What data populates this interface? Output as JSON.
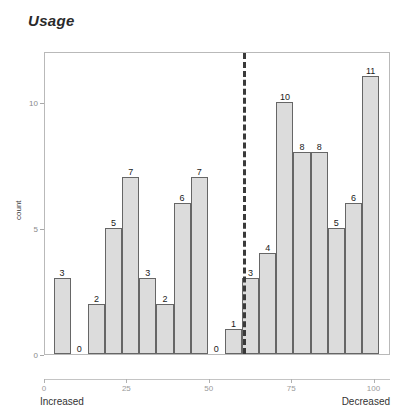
{
  "chart": {
    "title": "Usage"
  },
  "axes": {
    "y_label": "count",
    "x_left_label": "Increased",
    "x_right_label": "Decreased"
  },
  "chart_data": {
    "type": "bar",
    "title": "Usage",
    "xlabel": "",
    "ylabel": "count",
    "xlim": [
      0,
      105
    ],
    "ylim": [
      0,
      12
    ],
    "grid": false,
    "legend": null,
    "x_ticks": [
      0,
      25,
      50,
      75,
      100
    ],
    "x_tick_labels": [
      "0",
      "25",
      "50",
      "75",
      "100"
    ],
    "y_ticks": [
      0,
      5,
      10
    ],
    "y_tick_labels": [
      "0",
      "5",
      "10"
    ],
    "x_axis_endpoints": {
      "left": "Increased",
      "right": "Decreased"
    },
    "bin_centers": [
      5.2,
      10.4,
      15.6,
      20.8,
      26.0,
      31.2,
      36.4,
      41.6,
      46.8,
      52.0,
      57.2,
      62.4,
      67.6,
      72.8,
      78.0,
      83.2,
      88.4,
      93.6,
      98.8
    ],
    "values": [
      3,
      0,
      2,
      5,
      7,
      3,
      2,
      6,
      7,
      0,
      1,
      3,
      4,
      10,
      8,
      8,
      5,
      6,
      11
    ],
    "bar_labels": [
      "3",
      "0",
      "2",
      "5",
      "7",
      "3",
      "2",
      "6",
      "7",
      "0",
      "1",
      "3",
      "4",
      "10",
      "8",
      "8",
      "5",
      "6",
      "11"
    ],
    "annotations": [
      {
        "type": "vertical-dashed-line",
        "x": 60.0,
        "style": "dashed",
        "color": "#3a3a3a"
      }
    ],
    "colors": {
      "bar_fill": "#dcdcdc",
      "bar_stroke": "#666666",
      "reference_line": "#3a3a3a",
      "title": "#2a2a2a",
      "axis": "#b9b9b9"
    }
  }
}
